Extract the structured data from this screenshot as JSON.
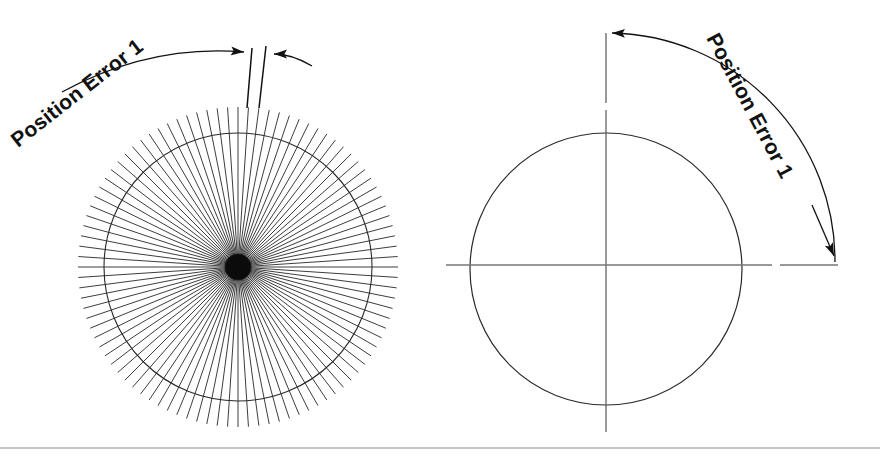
{
  "figure": {
    "background_color": "#ffffff",
    "line_color": "#1a1a1a",
    "rule_color": "#b3b3b3",
    "width": 880,
    "height": 458
  },
  "left_panel": {
    "name": "radial-spoke-diagram",
    "label": "Position Error 1",
    "label_rotation_deg": -38,
    "label_x": 18,
    "label_y": 148,
    "center": {
      "x": 238,
      "y": 267
    },
    "spoke_count": 96,
    "spoke_inner_radius": 6,
    "spoke_outer_radius": 160,
    "circle_radius": 134,
    "extension_lines": [
      {
        "x1": 252,
        "y1": 48,
        "x2": 247,
        "y2": 108
      },
      {
        "x1": 266,
        "y1": 46,
        "x2": 259,
        "y2": 108
      }
    ],
    "dimension": {
      "left_arrow_tip_x": 250,
      "left_arrow_tip_y": 53,
      "right_arrow_tip_x": 268,
      "right_arrow_tip_y": 54,
      "leader_arc_start_x": 62,
      "leader_arc_start_y": 92
    }
  },
  "right_panel": {
    "name": "circle-crosshair-diagram",
    "label": "Position Error 1",
    "label_rotation_deg": 62,
    "center": {
      "x": 606,
      "y": 269
    },
    "circle_radius": 136,
    "vertical_axis": {
      "x": 606,
      "y_top": 31,
      "y_bottom": 432
    },
    "horizontal_axis": {
      "y": 265,
      "x_left": 446,
      "x_right": 838
    },
    "sweep_arc": {
      "radius": 228,
      "start_x": 612,
      "start_y": 33,
      "end_x": 835,
      "end_y": 262,
      "start_arrow": "left",
      "end_arrow": "down"
    }
  },
  "footer": {
    "rule_y": 448,
    "rule_color": "#b3b3b3"
  }
}
